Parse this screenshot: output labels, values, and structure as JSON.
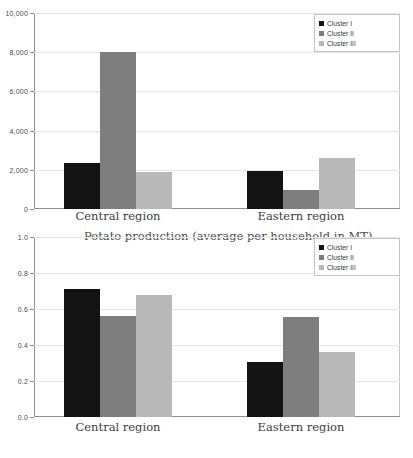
{
  "figure": {
    "background": "#ffffff",
    "series_colors": {
      "cluster_i": "#131313",
      "cluster_ii": "#7e7e7e",
      "cluster_iii": "#b8b8b8"
    }
  },
  "legend": {
    "items": [
      {
        "label": "Cluster I",
        "color": "#131313"
      },
      {
        "label": "Cluster II",
        "color": "#7e7e7e"
      },
      {
        "label": "Cluster III",
        "color": "#b8b8b8"
      }
    ]
  },
  "chart_data": [
    {
      "id": "top",
      "type": "bar",
      "title": "",
      "xlabel": "",
      "ylabel": "",
      "categories": [
        "Central region",
        "Eastern region"
      ],
      "series": [
        {
          "name": "Cluster I",
          "values": [
            2350,
            1950
          ]
        },
        {
          "name": "Cluster II",
          "values": [
            8000,
            960
          ]
        },
        {
          "name": "Cluster III",
          "values": [
            1900,
            2600
          ]
        }
      ],
      "ylim": [
        0,
        10000
      ],
      "yticks": [
        0,
        2000,
        4000,
        6000,
        8000,
        10000
      ],
      "ytick_labels": [
        "0",
        "2,000",
        "4,000",
        "6,000",
        "8,000",
        "10,000"
      ],
      "grid": true,
      "legend_position": "top-right"
    },
    {
      "id": "bottom",
      "type": "bar",
      "title": "Potato production (average per household in MT)",
      "xlabel": "",
      "ylabel": "",
      "categories": [
        "Central region",
        "Eastern region"
      ],
      "series": [
        {
          "name": "Cluster I",
          "values": [
            0.71,
            0.305
          ]
        },
        {
          "name": "Cluster II",
          "values": [
            0.56,
            0.555
          ]
        },
        {
          "name": "Cluster III",
          "values": [
            0.68,
            0.36
          ]
        }
      ],
      "ylim": [
        0,
        1.0
      ],
      "yticks": [
        0.0,
        0.2,
        0.4,
        0.6,
        0.8,
        1.0
      ],
      "ytick_labels": [
        "0.0",
        "0.2",
        "0.4",
        "0.6",
        "0.8",
        "1.0"
      ],
      "grid": true,
      "legend_position": "top-right"
    }
  ]
}
